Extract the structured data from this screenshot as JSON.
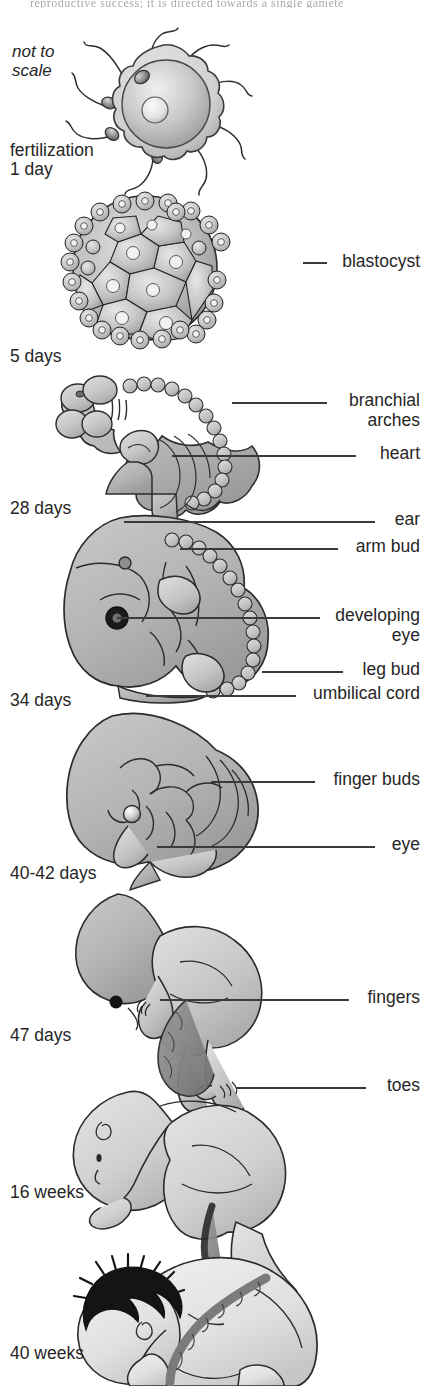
{
  "figure": {
    "title_cut_off": "reproductive success; it is directed towards a single gamete",
    "note": "not to\nscale",
    "background": "#ffffff",
    "ink": "#262626",
    "tissue_light": "#d9d9d9",
    "tissue_mid": "#b8b8b8",
    "tissue_dark": "#8f8f8f",
    "hair": "#141414",
    "leader_color": "#3a3a3a"
  },
  "stages": [
    {
      "label": "fertilization\n1 day",
      "x": 10,
      "y": 141
    },
    {
      "label": "5 days",
      "x": 10,
      "y": 347
    },
    {
      "label": "28 days",
      "x": 10,
      "y": 499
    },
    {
      "label": "34 days",
      "x": 10,
      "y": 691
    },
    {
      "label": "40-42 days",
      "x": 10,
      "y": 864
    },
    {
      "label": "47 days",
      "x": 10,
      "y": 1026
    },
    {
      "label": "16 weeks",
      "x": 10,
      "y": 1183
    },
    {
      "label": "40 weeks",
      "x": 10,
      "y": 1344
    }
  ],
  "callouts": [
    {
      "text": "blastocyst",
      "label_right": 420,
      "label_top": 252,
      "line_x1": 303,
      "line_x2": 327,
      "line_y": 263
    },
    {
      "text": "branchial\narches",
      "label_right": 420,
      "label_top": 391,
      "line_x1": 232,
      "line_x2": 327,
      "line_y": 403
    },
    {
      "text": "heart",
      "label_right": 420,
      "label_top": 444,
      "line_x1": 172,
      "line_x2": 356,
      "line_y": 456
    },
    {
      "text": "ear",
      "label_right": 420,
      "label_top": 510,
      "line_x1": 124,
      "line_x2": 375,
      "line_y": 522
    },
    {
      "text": "arm bud",
      "label_right": 420,
      "label_top": 537,
      "line_x1": 180,
      "line_x2": 338,
      "line_y": 549
    },
    {
      "text": "developing\neye",
      "label_right": 420,
      "label_top": 606,
      "line_x1": 117,
      "line_x2": 320,
      "line_y": 618
    },
    {
      "text": "leg bud",
      "label_right": 420,
      "label_top": 660,
      "line_x1": 262,
      "line_x2": 343,
      "line_y": 672
    },
    {
      "text": "umbilical cord",
      "label_right": 420,
      "label_top": 684,
      "line_x1": 146,
      "line_x2": 296,
      "line_y": 696
    },
    {
      "text": "finger buds",
      "label_right": 420,
      "label_top": 770,
      "line_x1": 211,
      "line_x2": 315,
      "line_y": 782
    },
    {
      "text": "eye",
      "label_right": 420,
      "label_top": 835,
      "line_x1": 157,
      "line_x2": 375,
      "line_y": 847
    },
    {
      "text": "fingers",
      "label_right": 420,
      "label_top": 988,
      "line_x1": 160,
      "line_x2": 349,
      "line_y": 1000
    },
    {
      "text": "toes",
      "label_right": 420,
      "label_top": 1076,
      "line_x1": 236,
      "line_x2": 366,
      "line_y": 1088
    }
  ]
}
